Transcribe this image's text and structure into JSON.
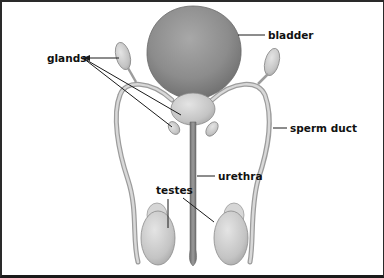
{
  "diagram": {
    "labels": {
      "glands": "glands",
      "bladder": "bladder",
      "sperm_duct": "sperm duct",
      "urethra": "urethra",
      "testes": "testes"
    },
    "colors": {
      "bladder": "#8a8a8a",
      "tissue": "#c8c8c8",
      "duct": "#b8b8b8",
      "leader_line": "#1a1a1a",
      "border": "#2a2a2a"
    }
  }
}
